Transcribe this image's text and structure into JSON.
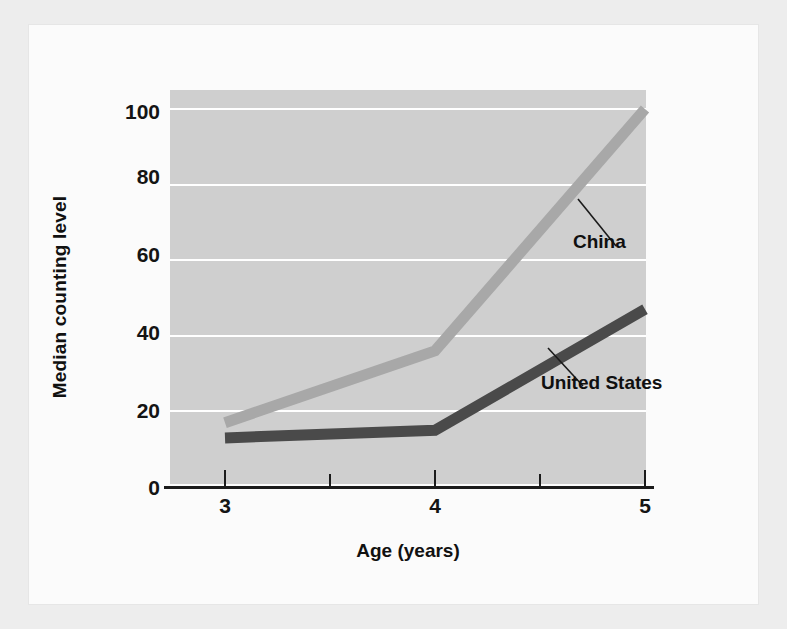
{
  "figure": {
    "background_color": "#fbfbfb",
    "frame_color": "#ededed",
    "plot_band_color": "#cfcfcf",
    "gridline_color": "#ffffff",
    "axis_color": "#1b1b1b"
  },
  "chart_data": {
    "type": "line",
    "title": "",
    "xlabel": "Age (years)",
    "ylabel": "Median counting level",
    "x": [
      3,
      4,
      5
    ],
    "xlim": [
      2.6,
      5.35
    ],
    "ylim": [
      0,
      105
    ],
    "xticks": [
      3,
      4,
      5
    ],
    "xticklabels": [
      "3",
      "4",
      "5"
    ],
    "xminorticks": [
      3.5,
      4.5
    ],
    "yticks": [
      0,
      20,
      40,
      60,
      80,
      100
    ],
    "yticklabels": [
      "0",
      "20",
      "40",
      "60",
      "80",
      "100"
    ],
    "grid": "horizontal",
    "legend_position": "inline-labels",
    "series": [
      {
        "name": "China",
        "color": "#a8a8a8",
        "values": [
          17,
          36,
          100
        ],
        "label_text": "China",
        "label_x": 573,
        "label_y": 231
      },
      {
        "name": "United States",
        "color": "#4a4a4a",
        "values": [
          13,
          15,
          47
        ],
        "label_text": "United States",
        "label_x": 541,
        "label_y": 372
      }
    ],
    "annotations": [
      {
        "name": "china-leader-line",
        "from": [
          616,
          246
        ],
        "to": [
          578,
          200
        ]
      },
      {
        "name": "united-states-leader-line",
        "from": [
          583,
          386
        ],
        "to": [
          548,
          349
        ]
      }
    ]
  }
}
